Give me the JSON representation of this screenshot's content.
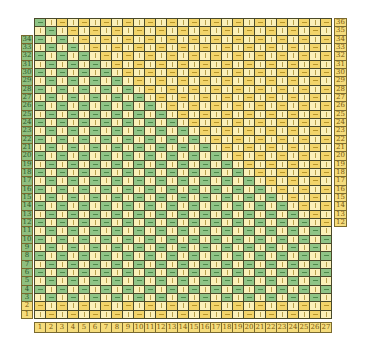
{
  "board": {
    "columns": 27,
    "rows": 36,
    "grid_origin": {
      "x": 34,
      "y": 18
    },
    "cell_width": 11,
    "cell_height": 8.33,
    "column_labels": [
      "1",
      "2",
      "3",
      "4",
      "5",
      "6",
      "7",
      "8",
      "9",
      "10",
      "11",
      "12",
      "13",
      "14",
      "15",
      "16",
      "17",
      "18",
      "19",
      "20",
      "21",
      "22",
      "23",
      "24",
      "25",
      "26",
      "27"
    ],
    "left_row_labels": {
      "from": 1,
      "to": 34
    },
    "right_row_labels": {
      "from": 12,
      "to": 36
    },
    "cell_symbols": {
      "horizontal": "—",
      "vertical": "|"
    },
    "pattern_rule": "horizontal when (row+col) odd; green when row>=3 and row+col<=37, else yellow",
    "colors": {
      "green_fill": "#8fc486",
      "green_mark": "#4e8a4a",
      "yellow_fill": "#f2d46a",
      "yellow_mark": "#b8962a",
      "cream_fill": "#fbf0b8",
      "cream_mark": "#b8a04a",
      "green_label_fill": "#8fbf7f",
      "yellow_label_fill": "#f5dc7c",
      "grid_line": "#4a4a2a"
    }
  }
}
